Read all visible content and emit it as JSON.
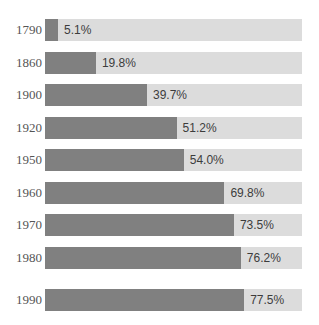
{
  "chart_data": {
    "type": "bar",
    "orientation": "horizontal",
    "title": "",
    "subtitle": "",
    "xlabel": "",
    "ylabel": "",
    "xlim": [
      0,
      100
    ],
    "grid": false,
    "legend": null,
    "value_suffix": "%",
    "categories": [
      "1790",
      "1860",
      "1900",
      "1920",
      "1950",
      "1960",
      "1970",
      "1980",
      "1990"
    ],
    "values": [
      5.1,
      19.8,
      39.7,
      51.2,
      54.0,
      69.8,
      73.5,
      76.2,
      77.5
    ],
    "value_labels": [
      "5.1%",
      "19.8%",
      "39.7%",
      "51.2%",
      "54.0%",
      "69.8%",
      "73.5%",
      "76.2%",
      "77.5%"
    ],
    "colors": {
      "bar_fill": "#808080",
      "bar_track": "#dcdcdc",
      "background": "#ffffff",
      "category_label": "#555555",
      "value_label": "#3c3c3c"
    }
  }
}
